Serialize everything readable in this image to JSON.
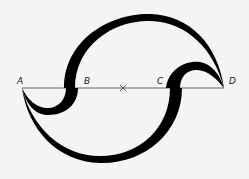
{
  "diagram": {
    "type": "geometric-construction",
    "points": [
      {
        "label": "A",
        "x": 22
      },
      {
        "label": "B",
        "x": 72
      },
      {
        "label": "C",
        "x": 174
      },
      {
        "label": "D",
        "x": 224
      }
    ],
    "center_mark": "×",
    "colors": {
      "stroke": "#000000",
      "line": "#555555",
      "background": "#f4f4f2"
    }
  }
}
